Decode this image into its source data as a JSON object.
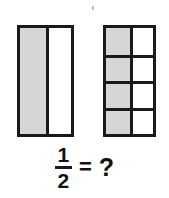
{
  "figure": {
    "artifact_mark": "scan-speck"
  },
  "models": [
    {
      "id": "bar-halves",
      "name": "two-part-bar",
      "columns": 2,
      "rows": 1,
      "total_parts": 2,
      "shaded_parts": 1,
      "cells": [
        {
          "label": "half-1",
          "shaded": true
        },
        {
          "label": "half-2",
          "shaded": false
        }
      ]
    },
    {
      "id": "bar-eighths",
      "name": "eight-part-bar",
      "columns": 2,
      "rows": 4,
      "total_parts": 8,
      "shaded_parts": 4,
      "cells": [
        {
          "label": "eighth-1",
          "shaded": true
        },
        {
          "label": "eighth-2",
          "shaded": false
        },
        {
          "label": "eighth-3",
          "shaded": true
        },
        {
          "label": "eighth-4",
          "shaded": false
        },
        {
          "label": "eighth-5",
          "shaded": true
        },
        {
          "label": "eighth-6",
          "shaded": false
        },
        {
          "label": "eighth-7",
          "shaded": true
        },
        {
          "label": "eighth-8",
          "shaded": false
        }
      ]
    }
  ],
  "equation": {
    "fraction": {
      "numerator": "1",
      "denominator": "2"
    },
    "operator": "=",
    "answer_placeholder": "?"
  },
  "colors": {
    "ink": "#1a1a1a",
    "shaded_fill": "#d6d6d6",
    "unshaded_fill": "#ffffff",
    "background": "#ffffff"
  }
}
